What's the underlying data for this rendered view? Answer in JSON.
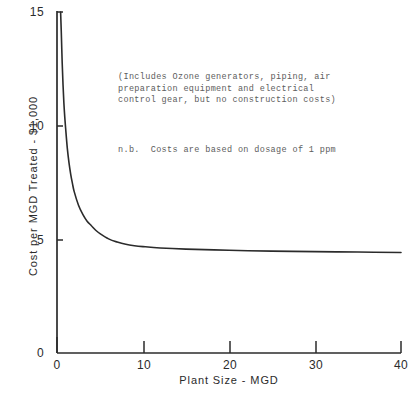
{
  "chart_data": {
    "type": "line",
    "title": "",
    "xlabel": "Plant Size - MGD",
    "ylabel": "Cost per MGD Treated - $1,000",
    "xlim": [
      0,
      40
    ],
    "ylim": [
      0,
      15
    ],
    "xticks": [
      0,
      10,
      20,
      30,
      40
    ],
    "yticks": [
      0,
      5,
      10,
      15
    ],
    "xtick_labels": [
      "0",
      "10",
      "20",
      "30",
      "40"
    ],
    "ytick_labels": [
      "0",
      "5",
      "10",
      "15"
    ],
    "grid": false,
    "legend": null,
    "series": [
      {
        "name": "Cost per MGD Treated",
        "x": [
          0.42,
          0.5,
          0.6,
          0.7,
          0.8,
          0.9,
          1.0,
          1.2,
          1.4,
          1.6,
          1.8,
          2.0,
          2.5,
          3.0,
          3.5,
          4.0,
          4.5,
          5.0,
          6.0,
          7.0,
          8.0,
          9.0,
          10.0,
          12.0,
          15.0,
          20.0,
          25.0,
          30.0,
          35.0,
          40.0
        ],
        "y": [
          15.0,
          14.1,
          12.8,
          11.8,
          11.0,
          10.4,
          9.9,
          9.0,
          8.35,
          7.85,
          7.45,
          7.1,
          6.5,
          6.1,
          5.8,
          5.6,
          5.4,
          5.25,
          5.02,
          4.88,
          4.78,
          4.72,
          4.68,
          4.62,
          4.57,
          4.52,
          4.48,
          4.46,
          4.44,
          4.42
        ]
      }
    ],
    "annotations": [
      "(Includes Ozone generators, piping, air\npreparation equipment and electrical\ncontrol gear, but no construction costs)",
      "n.b.  Costs are based on dosage of 1 ppm"
    ],
    "colors": {
      "background": "#ffffff",
      "axis": "#2b2b2b",
      "curve": "#2b2b2b",
      "annotation_text": "#5d5d5d",
      "tick_text": "#2b2b2b"
    }
  },
  "axis": {
    "y_title": "Cost per MGD Treated - $1,000",
    "x_title": "Plant Size - MGD",
    "y_ticks": [
      {
        "label": "15",
        "value": 15
      },
      {
        "label": "10",
        "value": 10
      },
      {
        "label": "5",
        "value": 5
      },
      {
        "label": "0",
        "value": 0
      }
    ],
    "x_ticks": [
      {
        "label": "0",
        "value": 0
      },
      {
        "label": "10",
        "value": 10
      },
      {
        "label": "20",
        "value": 20
      },
      {
        "label": "30",
        "value": 30
      },
      {
        "label": "40",
        "value": 40
      }
    ]
  },
  "notes": {
    "includes_line1": "(Includes Ozone generators, piping, air",
    "includes_line2": "preparation equipment and electrical",
    "includes_line3": "control gear, but no construction costs)",
    "nb": "n.b.  Costs are based on dosage of 1 ppm"
  }
}
